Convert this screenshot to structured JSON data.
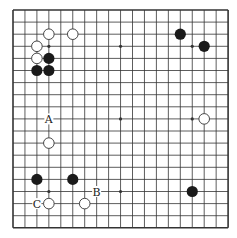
{
  "diagram": {
    "type": "go-board",
    "size": 19,
    "colors": {
      "background": "#ffffff",
      "line": "#333333",
      "black_stone": "#1a1a1a",
      "white_stone_fill": "#ffffff",
      "white_stone_stroke": "#333333"
    },
    "star_points": [
      [
        3,
        3
      ],
      [
        9,
        3
      ],
      [
        15,
        3
      ],
      [
        3,
        9
      ],
      [
        9,
        9
      ],
      [
        15,
        9
      ],
      [
        3,
        15
      ],
      [
        9,
        15
      ],
      [
        15,
        15
      ]
    ],
    "stones": [
      {
        "color": "white",
        "col": 3,
        "row": 2
      },
      {
        "color": "white",
        "col": 5,
        "row": 2
      },
      {
        "color": "white",
        "col": 2,
        "row": 3
      },
      {
        "color": "white",
        "col": 2,
        "row": 4
      },
      {
        "color": "black",
        "col": 3,
        "row": 4
      },
      {
        "color": "black",
        "col": 2,
        "row": 5
      },
      {
        "color": "black",
        "col": 3,
        "row": 5
      },
      {
        "color": "black",
        "col": 14,
        "row": 2
      },
      {
        "color": "black",
        "col": 16,
        "row": 3
      },
      {
        "color": "white",
        "col": 16,
        "row": 9
      },
      {
        "color": "white",
        "col": 3,
        "row": 11
      },
      {
        "color": "black",
        "col": 2,
        "row": 14
      },
      {
        "color": "black",
        "col": 5,
        "row": 14
      },
      {
        "color": "black",
        "col": 15,
        "row": 15
      },
      {
        "color": "white",
        "col": 3,
        "row": 16
      },
      {
        "color": "white",
        "col": 6,
        "row": 16
      }
    ],
    "labels": [
      {
        "text": "A",
        "col": 3,
        "row": 9
      },
      {
        "text": "B",
        "col": 7,
        "row": 15
      },
      {
        "text": "C",
        "col": 2,
        "row": 16
      }
    ]
  }
}
